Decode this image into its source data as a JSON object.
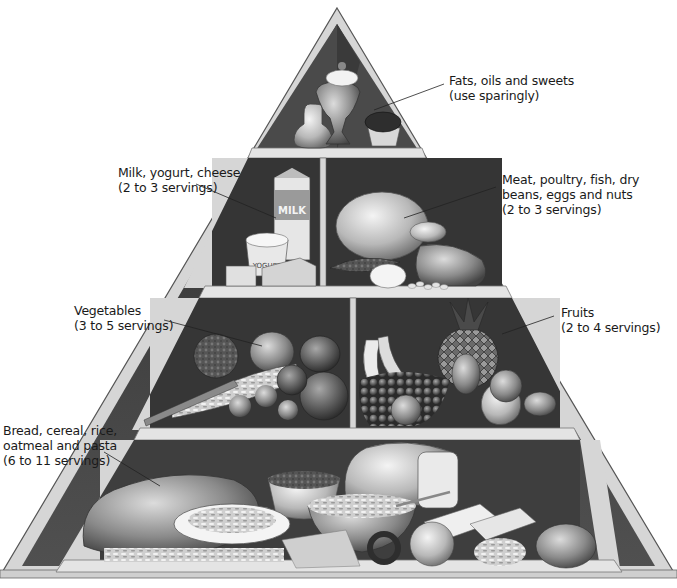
{
  "diagram": {
    "tiers": [
      {
        "id": "fats",
        "label_lines": [
          "Fats, oils and sweets",
          "(use sparingly)"
        ],
        "items": [
          "oil cruet",
          "ice cream sundae",
          "cupcake"
        ]
      },
      {
        "id": "milk",
        "label_lines": [
          "Milk, yogurt, cheese",
          "(2 to 3 servings)"
        ],
        "items": [
          "milk carton",
          "yogurt cup",
          "cheese wedge",
          "cheese cube"
        ],
        "carton_text": "MILK",
        "yogurt_text": "YOGURT"
      },
      {
        "id": "meat",
        "label_lines": [
          "Meat, poultry, fish, dry",
          "beans, eggs and nuts",
          "(2 to 3 servings)"
        ],
        "items": [
          "roast chicken",
          "fish",
          "egg",
          "steak",
          "beans"
        ]
      },
      {
        "id": "vegetables",
        "label_lines": [
          "Vegetables",
          "(3 to 5 servings)"
        ],
        "items": [
          "broccoli",
          "peppers",
          "corn",
          "carrots",
          "tomatoes",
          "brussels sprouts"
        ]
      },
      {
        "id": "fruits",
        "label_lines": [
          "Fruits",
          "(2 to 4 servings)"
        ],
        "items": [
          "bananas",
          "pineapple",
          "grapes",
          "orange",
          "pears",
          "apple",
          "lemon"
        ]
      },
      {
        "id": "grains",
        "label_lines": [
          "Bread, cereal, rice,",
          "oatmeal and pasta",
          "(6 to 11 servings)"
        ],
        "items": [
          "bread loaf",
          "rice bowl",
          "sliced bread",
          "pasta plate",
          "cereal bowl",
          "spaghetti",
          "pretzel",
          "rolls",
          "macaroni"
        ]
      }
    ]
  },
  "colors": {
    "frame": "#d8d8d8",
    "frame_edge": "#6a6a6a",
    "interior_dark": "#3a3a3a",
    "interior_mid": "#5c5c5c",
    "shelf": "#e2e2e2",
    "text": "#1a1a1a"
  }
}
